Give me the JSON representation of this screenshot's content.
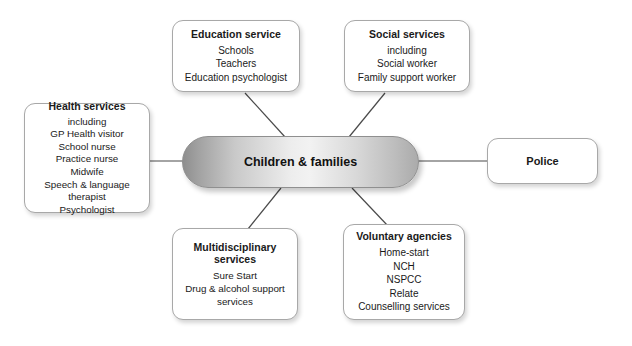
{
  "diagram": {
    "hub": {
      "label": "Children & families",
      "fill_light": "#f2f2f2",
      "fill_dark": "#8e8e8e"
    },
    "nodes": [
      {
        "id": "health",
        "title": "Health services",
        "items": [
          "including",
          "GP Health visitor",
          "School nurse",
          "Practice nurse",
          "Midwife",
          "Speech & language",
          "therapist",
          "Psychologist"
        ]
      },
      {
        "id": "education",
        "title": "Education service",
        "items": [
          "Schools",
          "Teachers",
          "Education psychologist"
        ]
      },
      {
        "id": "social",
        "title": "Social services",
        "items": [
          "including",
          "Social worker",
          "Family support worker"
        ]
      },
      {
        "id": "police",
        "title": "Police",
        "items": []
      },
      {
        "id": "multi",
        "title": "Multidisciplinary\nservices",
        "items": [
          "Sure Start",
          "Drug & alcohol support",
          "services"
        ]
      },
      {
        "id": "voluntary",
        "title": "Voluntary agencies",
        "items": [
          "Home-start",
          "NCH",
          "NSPCC",
          "NSPCC_placeholder",
          "Relate",
          "Counselling services"
        ]
      }
    ],
    "connector_color": "#4a4a4a"
  }
}
